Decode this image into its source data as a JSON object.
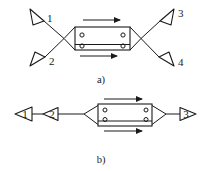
{
  "figure": {
    "title": "",
    "colors": {
      "stroke": "#1a1a1a",
      "background": "#ffffff",
      "fill": "#ffffff"
    },
    "panels": [
      {
        "id": "a",
        "caption": "a)",
        "description": "four-port directional coupler with horn antennas",
        "antennas": [
          {
            "label": "1",
            "position": "top-left",
            "orientation": "down-right"
          },
          {
            "label": "2",
            "position": "bottom-left",
            "orientation": "up-right"
          },
          {
            "label": "3",
            "position": "top-right",
            "orientation": "down-left"
          },
          {
            "label": "4",
            "position": "bottom-right",
            "orientation": "up-left"
          }
        ],
        "arrows": [
          {
            "name": "top-arrow",
            "direction": "right"
          },
          {
            "name": "bottom-arrow",
            "direction": "right"
          }
        ],
        "ports": [
          {
            "side": "left",
            "index": 1
          },
          {
            "side": "left",
            "index": 2
          },
          {
            "side": "right",
            "index": 1
          },
          {
            "side": "right",
            "index": 2
          }
        ]
      },
      {
        "id": "b",
        "caption": "b)",
        "description": "two-port chain with horn antennas and directional coupler",
        "antennas": [
          {
            "label": "1",
            "position": "far-left",
            "orientation": "left"
          },
          {
            "label": "2",
            "position": "left",
            "orientation": "left"
          },
          {
            "label": "3",
            "position": "right",
            "orientation": "right"
          }
        ],
        "arrows": [
          {
            "name": "top-arrow",
            "direction": "right"
          },
          {
            "name": "bottom-arrow",
            "direction": "right"
          }
        ],
        "ports": [
          {
            "side": "left",
            "index": 1
          },
          {
            "side": "left",
            "index": 2
          },
          {
            "side": "right",
            "index": 1
          },
          {
            "side": "right",
            "index": 2
          }
        ]
      }
    ]
  }
}
